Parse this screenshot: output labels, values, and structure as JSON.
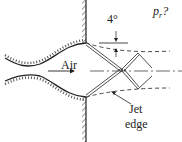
{
  "diagram": {
    "type": "supersonic jet exiting converging-diverging nozzle through a wall",
    "labels": {
      "angle": "4°",
      "pressure_symbol": "p",
      "pressure_subscript": "r",
      "pressure_suffix": "?",
      "flow": "Air",
      "jet_edge_line1": "Jet",
      "jet_edge_line2": "edge"
    },
    "colors": {
      "line": "#222222",
      "background": "#ffffff"
    }
  }
}
